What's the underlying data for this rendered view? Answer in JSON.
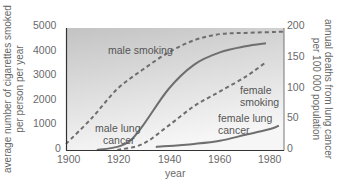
{
  "chart_data": {
    "type": "line",
    "title": "",
    "xlabel": "year",
    "ylabel_left": "average number of cigarettes smoked per person per year",
    "ylabel_right": "annual deaths from lung cancer per 100 000 population",
    "xlim": [
      1900,
      1985
    ],
    "ylim_left": [
      0,
      5000
    ],
    "ylim_right": [
      0,
      200
    ],
    "x_ticks": [
      "1900",
      "1920",
      "1940",
      "1960",
      "1980"
    ],
    "y_ticks_left": [
      "0",
      "1000",
      "2000",
      "3000",
      "4000",
      "5000"
    ],
    "y_ticks_right": [
      "0",
      "50",
      "100",
      "150",
      "200"
    ],
    "grid": false,
    "legend": "inline labels",
    "series": [
      {
        "name": "male smoking",
        "axis": "left",
        "style": "dashed",
        "x": [
          1900,
          1910,
          1920,
          1930,
          1940,
          1950,
          1960,
          1970,
          1985
        ],
        "values": [
          250,
          1300,
          2500,
          3300,
          4000,
          4500,
          4750,
          4800,
          4850
        ]
      },
      {
        "name": "male lung cancer",
        "axis": "right",
        "style": "solid",
        "x": [
          1912,
          1920,
          1925,
          1930,
          1940,
          1950,
          1960,
          1970,
          1978
        ],
        "values": [
          0,
          5,
          15,
          40,
          100,
          140,
          160,
          170,
          175
        ]
      },
      {
        "name": "female smoking",
        "axis": "left",
        "style": "dashed",
        "x": [
          1920,
          1930,
          1940,
          1950,
          1960,
          1970,
          1978
        ],
        "values": [
          0,
          250,
          1000,
          1800,
          2400,
          3000,
          3600
        ]
      },
      {
        "name": "female lung cancer",
        "axis": "right",
        "style": "solid",
        "x": [
          1935,
          1950,
          1960,
          1970,
          1980,
          1983
        ],
        "values": [
          5,
          10,
          15,
          25,
          35,
          40
        ]
      }
    ]
  },
  "labels": {
    "male_smoking": "male smoking",
    "male_lung_1": "male lung",
    "male_lung_2": "cancer",
    "female_smoking_1": "female",
    "female_smoking_2": "smoking",
    "female_lung_1": "female lung",
    "female_lung_2": "cancer",
    "xlabel": "year",
    "ylabel_left_1": "average number of cigarettes smoked",
    "ylabel_left_2": "per person per year",
    "ylabel_right_1": "annual deaths from lung cancer",
    "ylabel_right_2": "per 100 000 population"
  },
  "colors": {
    "line": "#6e6e6e",
    "plot_bg_top": "#c4c4c4",
    "plot_bg_bottom": "#f4f4f4",
    "axis": "#333333"
  }
}
